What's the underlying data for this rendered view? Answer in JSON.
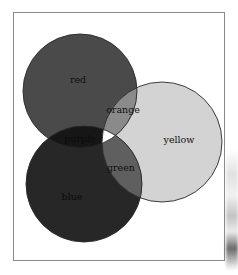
{
  "diagram": {
    "type": "venn",
    "sets": [
      {
        "id": "red",
        "label": "red",
        "fill": "#4a4a4a",
        "cx": 80,
        "cy": 91,
        "r": 57
      },
      {
        "id": "yellow",
        "label": "yellow",
        "fill": "#d3d3d3",
        "cx": 162,
        "cy": 142,
        "r": 60
      },
      {
        "id": "blue",
        "label": "blue",
        "fill": "#272727",
        "cx": 84,
        "cy": 184,
        "r": 58
      }
    ],
    "overlaps": [
      {
        "id": "orange",
        "sets": [
          "red",
          "yellow"
        ],
        "label": "orange",
        "fill": "#8a8a8a"
      },
      {
        "id": "green",
        "sets": [
          "yellow",
          "blue"
        ],
        "label": "green",
        "fill": "#5f5f5f"
      },
      {
        "id": "purple",
        "sets": [
          "red",
          "blue"
        ],
        "label": "purple",
        "fill": "#161616"
      },
      {
        "id": "center",
        "sets": [
          "red",
          "yellow",
          "blue"
        ],
        "label": "",
        "fill": "#ffffff"
      }
    ],
    "labels": {
      "red": "red",
      "yellow": "yellow",
      "blue": "blue",
      "orange": "orange",
      "green": "green",
      "purple": "purple"
    },
    "outline_color": "#2a2a2a",
    "frame_color": "#8a8a8a"
  }
}
